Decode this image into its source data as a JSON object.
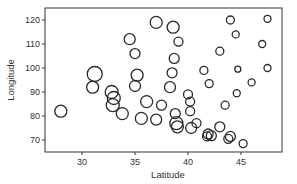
{
  "chart_data": {
    "type": "scatter",
    "title": "",
    "xlabel": "Latitude",
    "ylabel": "Longitude",
    "xlim": [
      26.5,
      49
    ],
    "ylim": [
      65.5,
      125
    ],
    "xticks": [
      30,
      35,
      40,
      45
    ],
    "yticks": [
      70,
      80,
      90,
      100,
      110,
      120
    ],
    "grid": false,
    "legend": null,
    "marker": "open-circle",
    "size_encodes": "third variable (unlabeled)",
    "points": [
      {
        "x": 28.0,
        "y": 82.0,
        "r": 6
      },
      {
        "x": 31.2,
        "y": 97.5,
        "r": 7.5
      },
      {
        "x": 31.0,
        "y": 92.0,
        "r": 6
      },
      {
        "x": 32.8,
        "y": 90.0,
        "r": 6.5
      },
      {
        "x": 33.0,
        "y": 87.5,
        "r": 6.5
      },
      {
        "x": 32.9,
        "y": 84.5,
        "r": 6.5
      },
      {
        "x": 33.8,
        "y": 81.0,
        "r": 6
      },
      {
        "x": 34.5,
        "y": 112.0,
        "r": 5.5
      },
      {
        "x": 35.0,
        "y": 106.0,
        "r": 5
      },
      {
        "x": 35.2,
        "y": 97.0,
        "r": 6
      },
      {
        "x": 35.0,
        "y": 92.5,
        "r": 5.5
      },
      {
        "x": 35.6,
        "y": 79.0,
        "r": 6
      },
      {
        "x": 36.1,
        "y": 86.0,
        "r": 6
      },
      {
        "x": 37.0,
        "y": 119.0,
        "r": 6
      },
      {
        "x": 38.6,
        "y": 117.0,
        "r": 6
      },
      {
        "x": 39.1,
        "y": 111.0,
        "r": 4.5
      },
      {
        "x": 38.7,
        "y": 104.0,
        "r": 5
      },
      {
        "x": 38.5,
        "y": 98.0,
        "r": 5
      },
      {
        "x": 38.3,
        "y": 92.0,
        "r": 5.5
      },
      {
        "x": 37.5,
        "y": 84.5,
        "r": 5
      },
      {
        "x": 38.8,
        "y": 81.0,
        "r": 5
      },
      {
        "x": 37.0,
        "y": 78.5,
        "r": 5.5
      },
      {
        "x": 38.9,
        "y": 77.0,
        "r": 6.5
      },
      {
        "x": 39.0,
        "y": 75.5,
        "r": 6
      },
      {
        "x": 40.3,
        "y": 75.0,
        "r": 5.5
      },
      {
        "x": 40.0,
        "y": 89.0,
        "r": 4.5
      },
      {
        "x": 40.2,
        "y": 86.0,
        "r": 4.5
      },
      {
        "x": 40.2,
        "y": 82.0,
        "r": 4.5
      },
      {
        "x": 40.8,
        "y": 77.0,
        "r": 4.5
      },
      {
        "x": 41.9,
        "y": 72.5,
        "r": 5
      },
      {
        "x": 41.8,
        "y": 71.5,
        "r": 4.5
      },
      {
        "x": 42.2,
        "y": 71.8,
        "r": 5
      },
      {
        "x": 41.5,
        "y": 99.0,
        "r": 4
      },
      {
        "x": 42.0,
        "y": 93.5,
        "r": 4
      },
      {
        "x": 43.0,
        "y": 107.0,
        "r": 4
      },
      {
        "x": 43.0,
        "y": 75.5,
        "r": 5
      },
      {
        "x": 43.5,
        "y": 84.5,
        "r": 4
      },
      {
        "x": 44.0,
        "y": 71.5,
        "r": 5
      },
      {
        "x": 43.8,
        "y": 70.5,
        "r": 4.5
      },
      {
        "x": 44.0,
        "y": 120.0,
        "r": 4
      },
      {
        "x": 44.5,
        "y": 114.0,
        "r": 3.5
      },
      {
        "x": 44.6,
        "y": 89.5,
        "r": 3.5
      },
      {
        "x": 44.7,
        "y": 99.5,
        "r": 3
      },
      {
        "x": 45.2,
        "y": 68.5,
        "r": 4
      },
      {
        "x": 46.0,
        "y": 94.0,
        "r": 3.5
      },
      {
        "x": 47.0,
        "y": 110.0,
        "r": 3.5
      },
      {
        "x": 47.5,
        "y": 120.5,
        "r": 3.5
      },
      {
        "x": 47.5,
        "y": 100.0,
        "r": 3.5
      }
    ]
  },
  "colors": {
    "marker_stroke": "#2a2a2a",
    "axis": "#333333",
    "background": "#ffffff"
  }
}
